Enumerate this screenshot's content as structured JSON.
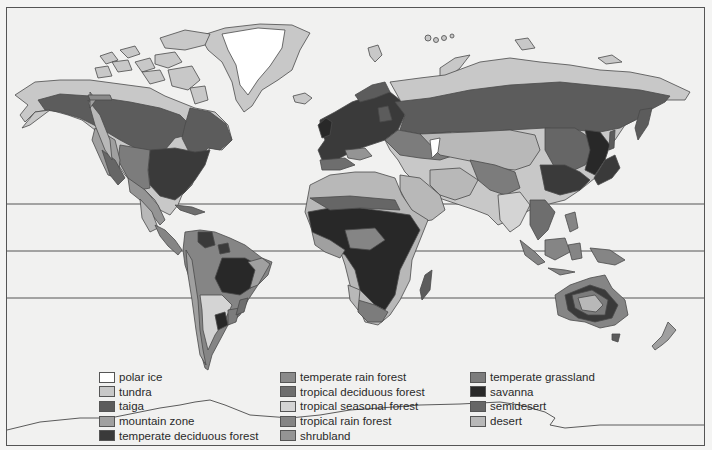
{
  "map": {
    "title": "World biomes",
    "latitude_lines_y": [
      204,
      251,
      298
    ],
    "colors": {
      "polar_ice": "#ffffff",
      "tundra": "#c8c8c8",
      "taiga": "#5c5c5c",
      "mountain_zone": "#a0a0a0",
      "temperate_deciduous_forest": "#3a3a3a",
      "temperate_rain_forest": "#8a8a8a",
      "tropical_deciduous_forest": "#6e6e6e",
      "tropical_seasonal_forest": "#d4d4d4",
      "tropical_rain_forest": "#858585",
      "shrubland": "#949494",
      "temperate_grassland": "#7c7c7c",
      "savanna": "#282828",
      "semidesert": "#666666",
      "desert": "#b8b8b8",
      "ocean": "#f1f1f0",
      "outline": "#4a4a4a"
    }
  },
  "legend": {
    "columns": [
      {
        "items": [
          {
            "label": "polar ice",
            "color": "#ffffff"
          },
          {
            "label": "tundra",
            "color": "#c8c8c8"
          },
          {
            "label": "taiga",
            "color": "#5c5c5c"
          },
          {
            "label": "mountain zone",
            "color": "#a0a0a0"
          },
          {
            "label": "temperate deciduous forest",
            "color": "#3a3a3a"
          }
        ]
      },
      {
        "items": [
          {
            "label": "temperate rain forest",
            "color": "#8a8a8a"
          },
          {
            "label": "tropical deciduous forest",
            "color": "#6e6e6e"
          },
          {
            "label": "tropical seasonal forest",
            "color": "#d4d4d4"
          },
          {
            "label": "tropical rain forest",
            "color": "#858585"
          },
          {
            "label": "shrubland",
            "color": "#949494"
          }
        ]
      },
      {
        "items": [
          {
            "label": "temperate grassland",
            "color": "#7c7c7c"
          },
          {
            "label": "savanna",
            "color": "#282828"
          },
          {
            "label": "semidesert",
            "color": "#666666"
          },
          {
            "label": "desert",
            "color": "#b8b8b8"
          }
        ]
      }
    ]
  }
}
